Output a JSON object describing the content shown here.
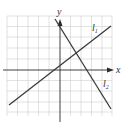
{
  "diagram": {
    "axes": {
      "x_label": "x",
      "y_label": "y"
    },
    "lines": [
      {
        "name": "l1",
        "label": "l",
        "subscript": "1"
      },
      {
        "name": "l2",
        "label": "l",
        "subscript": "2"
      }
    ],
    "colors": {
      "grid": "#c8c8c8",
      "axis": "#2a2a2a",
      "line": "#3a3a3a"
    }
  }
}
